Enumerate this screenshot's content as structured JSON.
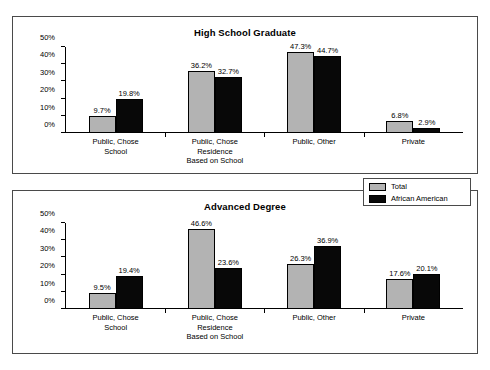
{
  "legend": {
    "entries": [
      {
        "label": "Total",
        "color": "#b3b3b3"
      },
      {
        "label": "African American",
        "color": "#080808"
      }
    ]
  },
  "axis": {
    "ticks": [
      "50%",
      "40%",
      "30%",
      "20%",
      "10%",
      "0%"
    ]
  },
  "chart_data": [
    {
      "type": "bar",
      "title": "High School Graduate",
      "xlabel": "",
      "ylabel": "",
      "ylim": [
        0,
        50
      ],
      "grid": false,
      "legend_position": "between-panels-right",
      "categories": [
        "Public, Chose\nSchool",
        "Public, Chose\nResidence\nBased on School",
        "Public, Other",
        "Private"
      ],
      "category_lines": [
        [
          "Public, Chose",
          "School"
        ],
        [
          "Public, Chose",
          "Residence",
          "Based on School"
        ],
        [
          "Public, Other"
        ],
        [
          "Private"
        ]
      ],
      "series": [
        {
          "name": "Total",
          "color": "#b3b3b3",
          "values": [
            9.7,
            36.2,
            47.3,
            6.8
          ],
          "labels": [
            "9.7%",
            "36.2%",
            "47.3%",
            "6.8%"
          ]
        },
        {
          "name": "African American",
          "color": "#080808",
          "values": [
            19.8,
            32.7,
            44.7,
            2.9
          ],
          "labels": [
            "19.8%",
            "32.7%",
            "44.7%",
            "2.9%"
          ]
        }
      ]
    },
    {
      "type": "bar",
      "title": "Advanced Degree",
      "xlabel": "",
      "ylabel": "",
      "ylim": [
        0,
        50
      ],
      "grid": false,
      "legend_position": "between-panels-right",
      "categories": [
        "Public, Chose\nSchool",
        "Public, Chose\nResidence\nBased on School",
        "Public, Other",
        "Private"
      ],
      "category_lines": [
        [
          "Public, Chose",
          "School"
        ],
        [
          "Public, Chose",
          "Residence",
          "Based on School"
        ],
        [
          "Public, Other"
        ],
        [
          "Private"
        ]
      ],
      "series": [
        {
          "name": "Total",
          "color": "#b3b3b3",
          "values": [
            9.5,
            46.6,
            26.3,
            17.6
          ],
          "labels": [
            "9.5%",
            "46.6%",
            "26.3%",
            "17.6%"
          ]
        },
        {
          "name": "African American",
          "color": "#080808",
          "values": [
            19.4,
            23.6,
            36.9,
            20.1
          ],
          "labels": [
            "19.4%",
            "23.6%",
            "36.9%",
            "20.1%"
          ]
        }
      ]
    }
  ]
}
